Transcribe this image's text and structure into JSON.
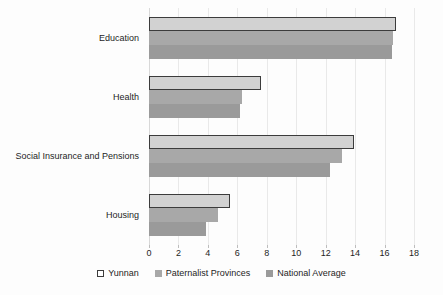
{
  "chart_data": {
    "type": "bar",
    "orientation": "horizontal",
    "title": "",
    "subtitle": "",
    "xlabel": "",
    "ylabel": "",
    "categories": [
      "Education",
      "Health",
      "Social Insurance and Pensions",
      "Housing"
    ],
    "series": [
      {
        "name": "Yunnan",
        "color": "#d2d2d2",
        "values": [
          16.8,
          7.6,
          13.9,
          5.5
        ]
      },
      {
        "name": "Paternalist Provinces",
        "color": "#a8a8a8",
        "values": [
          16.6,
          6.3,
          13.1,
          4.7
        ]
      },
      {
        "name": "National Average",
        "color": "#9a9a9a",
        "values": [
          16.5,
          6.2,
          12.3,
          3.9
        ]
      }
    ],
    "xlim": [
      0,
      18
    ],
    "xticks": [
      0,
      2,
      4,
      6,
      8,
      10,
      12,
      14,
      16,
      18
    ],
    "xtick_labels": [
      "0",
      "2",
      "4",
      "6",
      "8",
      "10",
      "12",
      "14",
      "16",
      "18"
    ],
    "grid": true,
    "grid_axis": "x",
    "legend_position": "bottom",
    "legend": [
      "Yunnan",
      "Paternalist Provinces",
      "National Average"
    ]
  }
}
